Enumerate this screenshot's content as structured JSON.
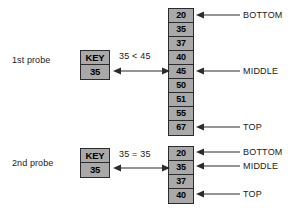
{
  "diagram": {
    "colors": {
      "cell_fill": "#a9a9a9",
      "cell_border": "#2b2b2b",
      "text": "#1a1a1a",
      "background": "#ffffff"
    },
    "probes": [
      {
        "id": "probe1",
        "label": "1st probe",
        "key_header": "KEY",
        "key_value": "35",
        "comparison": "35 < 45",
        "array": [
          "20",
          "35",
          "37",
          "40",
          "45",
          "50",
          "51",
          "55",
          "67"
        ],
        "pointers": [
          {
            "name": "BOTTOM",
            "label": "BOTTOM",
            "index": 0
          },
          {
            "name": "MIDDLE",
            "label": "MIDDLE",
            "index": 4
          },
          {
            "name": "TOP",
            "label": "TOP",
            "index": 8
          }
        ]
      },
      {
        "id": "probe2",
        "label": "2nd probe",
        "key_header": "KEY",
        "key_value": "35",
        "comparison": "35 = 35",
        "array": [
          "20",
          "35",
          "37",
          "40"
        ],
        "pointers": [
          {
            "name": "BOTTOM",
            "label": "BOTTOM",
            "index": 0
          },
          {
            "name": "MIDDLE",
            "label": "MIDDLE",
            "index": 1
          },
          {
            "name": "TOP",
            "label": "TOP",
            "index": 3
          }
        ]
      }
    ]
  }
}
